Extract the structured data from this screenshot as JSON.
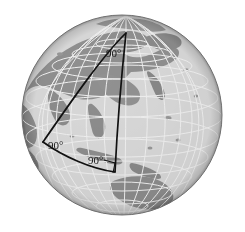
{
  "figure": {
    "background_color": "#ffffff",
    "globe": {
      "center_x": 122,
      "center_y": 115,
      "radius": 100,
      "ocean_color": "#d8d8d8",
      "land_color": "#8f8f8f",
      "graticule_color": "#f2f2f2",
      "outline_color": "#6e6e6e",
      "shadow_color": "#b8b8b8",
      "highlight_color": "#e8e8e8",
      "graticule_spacing_degrees": 15,
      "projection": "orthographic",
      "view_center_longitude": 115,
      "view_center_latitude": 12,
      "visible_landmasses": [
        "Asia",
        "Siberia",
        "India",
        "Southeast Asia",
        "Indonesia",
        "Australia",
        "Japan",
        "Arabian Peninsula",
        "Northeast Africa"
      ]
    },
    "triangle": {
      "stroke_color": "#111111",
      "stroke_width": 1.6,
      "fill": "none",
      "description": "Spherical triangle whose apex lies at the north pole and whose base lies on the equator; all three interior angles are right angles.",
      "vertices": [
        {
          "name": "north-pole-vertex",
          "x": 126,
          "y": 33
        },
        {
          "name": "equator-west-vertex",
          "x": 43,
          "y": 142
        },
        {
          "name": "equator-east-vertex",
          "x": 115,
          "y": 172
        }
      ],
      "right_angle_marker": {
        "name": "right-angle-square",
        "x": 105,
        "y": 162,
        "size": 11
      }
    },
    "labels": [
      {
        "id": "apex",
        "text": "90°",
        "x": 106,
        "y": 55,
        "anchor": "start"
      },
      {
        "id": "west",
        "text": "90°",
        "x": 48,
        "y": 148,
        "anchor": "start"
      },
      {
        "id": "base",
        "text": "90°",
        "x": 88,
        "y": 163,
        "anchor": "start"
      }
    ],
    "angle_values": [
      "90°",
      "90°",
      "90°"
    ],
    "angle_sum": "270°"
  }
}
